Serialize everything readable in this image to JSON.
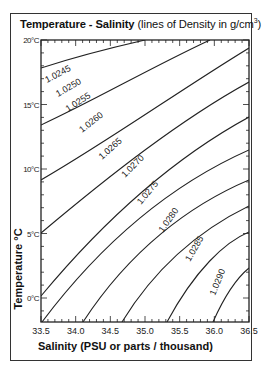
{
  "title": {
    "bold": "Temperature - Salinity",
    "normal": " (lines of Density in g/cm",
    "sup": "3",
    "close": ")"
  },
  "axes": {
    "ylabel": "Temperature °C",
    "xlabel": "Salinity (PSU or parts / thousand)",
    "yticks": [
      "20°C",
      "15°C",
      "10°C",
      "5°C",
      "0°C"
    ],
    "xticks": [
      "33.5",
      "34.0",
      "34.5",
      "35.0",
      "35.5",
      "36.0",
      "36.5"
    ]
  },
  "caption": "",
  "chart_data": {
    "type": "line",
    "title": "Temperature - Salinity (lines of Density in g/cm3)",
    "xlabel": "Salinity (PSU or parts / thousand)",
    "ylabel": "Temperature °C",
    "xlim": [
      33.5,
      36.5
    ],
    "ylim": [
      -1.9,
      20
    ],
    "x_ticks": [
      33.5,
      34.0,
      34.5,
      35.0,
      35.5,
      36.0,
      36.5
    ],
    "y_ticks": [
      0,
      5,
      10,
      15,
      20
    ],
    "grid": false,
    "legend": "none (inline contour labels)",
    "series": [
      {
        "name": "1.0245",
        "points": [
          [
            33.5,
            17.3
          ],
          [
            34.3,
            19.0
          ],
          [
            35.0,
            20.0
          ]
        ]
      },
      {
        "name": "1.0250",
        "points": [
          [
            33.5,
            12.9
          ],
          [
            34.5,
            16.8
          ],
          [
            35.5,
            19.5
          ],
          [
            35.9,
            20.0
          ]
        ]
      },
      {
        "name": "1.0255",
        "points": [
          [
            33.5,
            8.6
          ],
          [
            34.5,
            12.8
          ],
          [
            35.5,
            16.6
          ],
          [
            36.5,
            19.4
          ]
        ]
      },
      {
        "name": "1.0260",
        "points": [
          [
            33.5,
            4.5
          ],
          [
            34.5,
            9.1
          ],
          [
            35.5,
            13.4
          ],
          [
            36.5,
            16.8
          ]
        ]
      },
      {
        "name": "1.0265",
        "points": [
          [
            33.5,
            0.2
          ],
          [
            34.5,
            5.5
          ],
          [
            35.5,
            10.2
          ],
          [
            36.5,
            14.0
          ]
        ]
      },
      {
        "name": "1.0270",
        "points": [
          [
            33.5,
            -1.7
          ],
          [
            34.0,
            1.2
          ],
          [
            35.0,
            6.5
          ],
          [
            36.5,
            11.5
          ]
        ]
      },
      {
        "name": "1.0275",
        "points": [
          [
            34.1,
            -1.9
          ],
          [
            35.0,
            3.2
          ],
          [
            36.0,
            7.6
          ],
          [
            36.5,
            9.2
          ]
        ]
      },
      {
        "name": "1.0280",
        "points": [
          [
            34.7,
            -1.9
          ],
          [
            35.5,
            2.4
          ],
          [
            36.5,
            6.8
          ]
        ]
      },
      {
        "name": "1.0285",
        "points": [
          [
            35.4,
            -1.9
          ],
          [
            36.0,
            1.7
          ],
          [
            36.5,
            4.0
          ]
        ]
      },
      {
        "name": "1.0290",
        "points": [
          [
            36.1,
            -1.9
          ],
          [
            36.3,
            -0.4
          ],
          [
            36.5,
            0.9
          ]
        ]
      }
    ]
  },
  "contours": [
    {
      "label": "1.0245",
      "d": "M41,68 C75,57 110,48 145,40",
      "lx": 47,
      "ly": 83,
      "rot": -28
    },
    {
      "label": "1.0250",
      "d": "M41,125 C95,100 150,68 210,40",
      "lx": 58,
      "ly": 97,
      "rot": -30
    },
    {
      "label": "1.0255",
      "d": "M41,180 C110,140 180,90 249,48",
      "lx": 68,
      "ly": 112,
      "rot": -33
    },
    {
      "label": "1.0260",
      "d": "M41,233 C110,175 180,120 249,82",
      "lx": 82,
      "ly": 133,
      "rot": -38
    },
    {
      "label": "1.0265",
      "d": "M41,296 C100,225 170,160 249,117",
      "lx": 102,
      "ly": 160,
      "rot": -42
    },
    {
      "label": "1.0270",
      "d": "M42,322 C100,245 170,185 249,150",
      "lx": 125,
      "ly": 178,
      "rot": -45
    },
    {
      "label": "1.0275",
      "d": "M83,322 C130,250 190,205 249,180",
      "lx": 141,
      "ly": 205,
      "rot": -50
    },
    {
      "label": "1.0280",
      "d": "M122,322 C160,260 210,225 249,206",
      "lx": 163,
      "ly": 233,
      "rot": -55
    },
    {
      "label": "1.0285",
      "d": "M167,322 C195,270 225,242 249,232",
      "lx": 190,
      "ly": 262,
      "rot": -60
    },
    {
      "label": "1.0290",
      "d": "M213,322 C225,295 238,277 249,268",
      "lx": 215,
      "ly": 296,
      "rot": -68
    }
  ],
  "colors": {
    "line": "#222222",
    "frame": "#333333",
    "background": "#ffffff"
  }
}
